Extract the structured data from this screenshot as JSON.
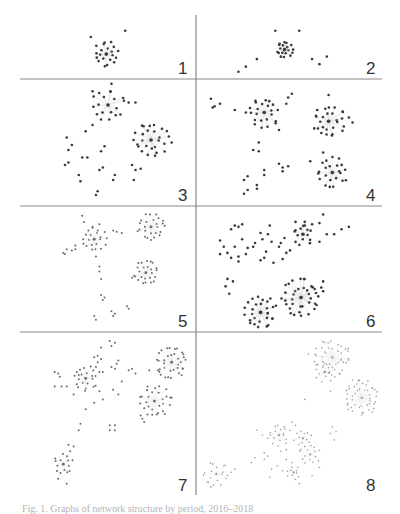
{
  "figure": {
    "caption": "Fig. 1. Graphs of network structure by period, 2016–2018",
    "panels": [
      {
        "label": "1",
        "density": "dark",
        "clusters": [
          {
            "cx": 0.49,
            "cy": 0.62,
            "r": 0.18,
            "n": 20
          }
        ],
        "satellites": [
          [
            0.4,
            0.35
          ],
          [
            0.6,
            0.25
          ]
        ]
      },
      {
        "label": "2",
        "density": "dark",
        "clusters": [
          {
            "cx": 0.47,
            "cy": 0.55,
            "r": 0.12,
            "n": 18
          }
        ],
        "satellites": [
          [
            0.42,
            0.25
          ],
          [
            0.55,
            0.25
          ],
          [
            0.32,
            0.7
          ],
          [
            0.26,
            0.82
          ],
          [
            0.22,
            0.9
          ],
          [
            0.62,
            0.7
          ],
          [
            0.66,
            0.78
          ],
          [
            0.7,
            0.66
          ]
        ]
      },
      {
        "label": "3",
        "density": "dark",
        "clusters": [
          {
            "cx": 0.5,
            "cy": 0.2,
            "r": 0.12,
            "n": 18
          },
          {
            "cx": 0.75,
            "cy": 0.48,
            "r": 0.13,
            "n": 26
          }
        ],
        "satellites": [
          [
            0.52,
            0.03
          ],
          [
            0.41,
            0.09
          ],
          [
            0.62,
            0.18
          ],
          [
            0.66,
            0.18
          ],
          [
            0.41,
            0.36
          ],
          [
            0.37,
            0.41
          ],
          [
            0.26,
            0.46
          ],
          [
            0.29,
            0.52
          ],
          [
            0.27,
            0.56
          ],
          [
            0.48,
            0.53
          ],
          [
            0.46,
            0.57
          ],
          [
            0.35,
            0.62
          ],
          [
            0.38,
            0.62
          ],
          [
            0.25,
            0.68
          ],
          [
            0.27,
            0.66
          ],
          [
            0.64,
            0.68
          ],
          [
            0.66,
            0.72
          ],
          [
            0.69,
            0.71
          ],
          [
            0.65,
            0.8
          ],
          [
            0.45,
            0.72
          ],
          [
            0.47,
            0.7
          ],
          [
            0.33,
            0.76
          ],
          [
            0.34,
            0.81
          ],
          [
            0.54,
            0.76
          ],
          [
            0.53,
            0.8
          ],
          [
            0.44,
            0.89
          ],
          [
            0.43,
            0.92
          ],
          [
            0.87,
            0.5
          ]
        ]
      },
      {
        "label": "4",
        "density": "dark",
        "clusters": [
          {
            "cx": 0.36,
            "cy": 0.26,
            "r": 0.11,
            "n": 22
          },
          {
            "cx": 0.71,
            "cy": 0.33,
            "r": 0.12,
            "n": 26
          },
          {
            "cx": 0.73,
            "cy": 0.74,
            "r": 0.11,
            "n": 22
          }
        ],
        "satellites": [
          [
            0.07,
            0.15
          ],
          [
            0.09,
            0.21
          ],
          [
            0.12,
            0.19
          ],
          [
            0.08,
            0.22
          ],
          [
            0.2,
            0.24
          ],
          [
            0.26,
            0.26
          ],
          [
            0.48,
            0.19
          ],
          [
            0.51,
            0.11
          ],
          [
            0.49,
            0.14
          ],
          [
            0.44,
            0.4
          ],
          [
            0.71,
            0.12
          ],
          [
            0.82,
            0.3
          ],
          [
            0.84,
            0.34
          ],
          [
            0.33,
            0.5
          ],
          [
            0.3,
            0.56
          ],
          [
            0.33,
            0.57
          ],
          [
            0.44,
            0.67
          ],
          [
            0.46,
            0.7
          ],
          [
            0.49,
            0.69
          ],
          [
            0.46,
            0.73
          ],
          [
            0.36,
            0.72
          ],
          [
            0.36,
            0.76
          ],
          [
            0.27,
            0.77
          ],
          [
            0.25,
            0.8
          ],
          [
            0.32,
            0.84
          ],
          [
            0.32,
            0.87
          ],
          [
            0.27,
            0.88
          ],
          [
            0.25,
            0.91
          ],
          [
            0.61,
            0.65
          ],
          [
            0.68,
            0.58
          ]
        ]
      },
      {
        "label": "5",
        "density": "light",
        "clusters": [
          {
            "cx": 0.42,
            "cy": 0.26,
            "r": 0.09,
            "n": 20
          },
          {
            "cx": 0.75,
            "cy": 0.16,
            "r": 0.1,
            "n": 24
          },
          {
            "cx": 0.72,
            "cy": 0.53,
            "r": 0.09,
            "n": 24
          }
        ],
        "satellites": [
          [
            0.35,
            0.07
          ],
          [
            0.36,
            0.12
          ],
          [
            0.41,
            0.16
          ],
          [
            0.45,
            0.14
          ],
          [
            0.53,
            0.19
          ],
          [
            0.55,
            0.2
          ],
          [
            0.58,
            0.21
          ],
          [
            0.31,
            0.31
          ],
          [
            0.31,
            0.34
          ],
          [
            0.29,
            0.35
          ],
          [
            0.26,
            0.34
          ],
          [
            0.24,
            0.37
          ],
          [
            0.25,
            0.38
          ],
          [
            0.43,
            0.4
          ],
          [
            0.45,
            0.48
          ],
          [
            0.45,
            0.52
          ],
          [
            0.46,
            0.58
          ],
          [
            0.46,
            0.71
          ],
          [
            0.48,
            0.73
          ],
          [
            0.47,
            0.75
          ],
          [
            0.64,
            0.57
          ],
          [
            0.61,
            0.8
          ],
          [
            0.62,
            0.82
          ],
          [
            0.52,
            0.84
          ],
          [
            0.54,
            0.86
          ],
          [
            0.53,
            0.88
          ],
          [
            0.42,
            0.88
          ],
          [
            0.43,
            0.91
          ],
          [
            0.82,
            0.11
          ]
        ]
      },
      {
        "label": "6",
        "density": "dark",
        "clusters": [
          {
            "cx": 0.57,
            "cy": 0.22,
            "r": 0.08,
            "n": 14
          },
          {
            "cx": 0.56,
            "cy": 0.73,
            "r": 0.14,
            "n": 36
          },
          {
            "cx": 0.34,
            "cy": 0.85,
            "r": 0.12,
            "n": 28
          }
        ],
        "satellites": [
          [
            0.18,
            0.18
          ],
          [
            0.2,
            0.15
          ],
          [
            0.22,
            0.16
          ],
          [
            0.24,
            0.14
          ],
          [
            0.12,
            0.27
          ],
          [
            0.14,
            0.32
          ],
          [
            0.12,
            0.38
          ],
          [
            0.16,
            0.37
          ],
          [
            0.2,
            0.32
          ],
          [
            0.22,
            0.4
          ],
          [
            0.26,
            0.38
          ],
          [
            0.22,
            0.44
          ],
          [
            0.18,
            0.41
          ],
          [
            0.24,
            0.26
          ],
          [
            0.27,
            0.33
          ],
          [
            0.3,
            0.32
          ],
          [
            0.31,
            0.29
          ],
          [
            0.34,
            0.21
          ],
          [
            0.35,
            0.26
          ],
          [
            0.37,
            0.36
          ],
          [
            0.38,
            0.22
          ],
          [
            0.39,
            0.15
          ],
          [
            0.4,
            0.28
          ],
          [
            0.45,
            0.29
          ],
          [
            0.44,
            0.32
          ],
          [
            0.47,
            0.25
          ],
          [
            0.48,
            0.37
          ],
          [
            0.46,
            0.42
          ],
          [
            0.41,
            0.45
          ],
          [
            0.36,
            0.41
          ],
          [
            0.34,
            0.43
          ],
          [
            0.5,
            0.35
          ],
          [
            0.53,
            0.12
          ],
          [
            0.58,
            0.12
          ],
          [
            0.62,
            0.14
          ],
          [
            0.66,
            0.13
          ],
          [
            0.68,
            0.06
          ],
          [
            0.7,
            0.22
          ],
          [
            0.74,
            0.22
          ],
          [
            0.78,
            0.18
          ],
          [
            0.82,
            0.16
          ],
          [
            0.66,
            0.28
          ],
          [
            0.16,
            0.58
          ],
          [
            0.15,
            0.64
          ],
          [
            0.19,
            0.6
          ],
          [
            0.17,
            0.7
          ],
          [
            0.67,
            0.65
          ],
          [
            0.68,
            0.68
          ],
          [
            0.68,
            0.6
          ]
        ]
      },
      {
        "label": "7",
        "density": "light",
        "clusters": [
          {
            "cx": 0.37,
            "cy": 0.28,
            "r": 0.07,
            "n": 20
          },
          {
            "cx": 0.87,
            "cy": 0.18,
            "r": 0.09,
            "n": 34
          },
          {
            "cx": 0.77,
            "cy": 0.42,
            "r": 0.09,
            "n": 26
          },
          {
            "cx": 0.24,
            "cy": 0.81,
            "r": 0.06,
            "n": 14
          }
        ],
        "satellites": [
          [
            0.51,
            0.05
          ],
          [
            0.54,
            0.06
          ],
          [
            0.52,
            0.08
          ],
          [
            0.46,
            0.09
          ],
          [
            0.44,
            0.14
          ],
          [
            0.42,
            0.15
          ],
          [
            0.46,
            0.16
          ],
          [
            0.44,
            0.18
          ],
          [
            0.43,
            0.21
          ],
          [
            0.45,
            0.24
          ],
          [
            0.47,
            0.24
          ],
          [
            0.52,
            0.21
          ],
          [
            0.55,
            0.19
          ],
          [
            0.56,
            0.17
          ],
          [
            0.54,
            0.22
          ],
          [
            0.62,
            0.23
          ],
          [
            0.64,
            0.22
          ],
          [
            0.66,
            0.25
          ],
          [
            0.74,
            0.23
          ],
          [
            0.79,
            0.23
          ],
          [
            0.19,
            0.24
          ],
          [
            0.21,
            0.25
          ],
          [
            0.22,
            0.27
          ],
          [
            0.19,
            0.33
          ],
          [
            0.23,
            0.33
          ],
          [
            0.26,
            0.33
          ],
          [
            0.3,
            0.38
          ],
          [
            0.33,
            0.26
          ],
          [
            0.45,
            0.36
          ],
          [
            0.47,
            0.41
          ],
          [
            0.53,
            0.35
          ],
          [
            0.56,
            0.38
          ],
          [
            0.58,
            0.3
          ],
          [
            0.42,
            0.43
          ],
          [
            0.37,
            0.47
          ],
          [
            0.73,
            0.33
          ],
          [
            0.69,
            0.51
          ],
          [
            0.7,
            0.53
          ],
          [
            0.71,
            0.55
          ],
          [
            0.83,
            0.5
          ],
          [
            0.87,
            0.4
          ],
          [
            0.34,
            0.56
          ],
          [
            0.33,
            0.6
          ],
          [
            0.51,
            0.57
          ],
          [
            0.54,
            0.57
          ],
          [
            0.51,
            0.6
          ],
          [
            0.54,
            0.6
          ],
          [
            0.27,
            0.69
          ],
          [
            0.3,
            0.7
          ],
          [
            0.28,
            0.73
          ],
          [
            0.21,
            0.9
          ],
          [
            0.26,
            0.93
          ]
        ]
      },
      {
        "label": "8",
        "density": "faint",
        "clusters": [
          {
            "cx": 0.73,
            "cy": 0.15,
            "r": 0.1,
            "n": 40
          },
          {
            "cx": 0.69,
            "cy": 0.24,
            "r": 0.06,
            "n": 14
          },
          {
            "cx": 0.89,
            "cy": 0.4,
            "r": 0.1,
            "n": 44
          },
          {
            "cx": 0.44,
            "cy": 0.63,
            "r": 0.06,
            "n": 16
          },
          {
            "cx": 0.57,
            "cy": 0.65,
            "r": 0.05,
            "n": 12
          },
          {
            "cx": 0.61,
            "cy": 0.75,
            "r": 0.06,
            "n": 14
          },
          {
            "cx": 0.1,
            "cy": 0.87,
            "r": 0.07,
            "n": 16
          },
          {
            "cx": 0.52,
            "cy": 0.86,
            "r": 0.04,
            "n": 10
          }
        ],
        "satellites": [
          [
            0.6,
            0.13
          ],
          [
            0.79,
            0.18
          ],
          [
            0.84,
            0.29
          ],
          [
            0.85,
            0.33
          ],
          [
            0.72,
            0.36
          ],
          [
            0.58,
            0.41
          ],
          [
            0.51,
            0.55
          ],
          [
            0.53,
            0.57
          ],
          [
            0.5,
            0.6
          ],
          [
            0.32,
            0.6
          ],
          [
            0.35,
            0.63
          ],
          [
            0.38,
            0.65
          ],
          [
            0.73,
            0.58
          ],
          [
            0.72,
            0.62
          ],
          [
            0.75,
            0.61
          ],
          [
            0.74,
            0.66
          ],
          [
            0.36,
            0.74
          ],
          [
            0.38,
            0.76
          ],
          [
            0.36,
            0.78
          ],
          [
            0.31,
            0.77
          ],
          [
            0.29,
            0.8
          ],
          [
            0.45,
            0.73
          ],
          [
            0.48,
            0.72
          ],
          [
            0.48,
            0.78
          ],
          [
            0.51,
            0.8
          ],
          [
            0.4,
            0.84
          ],
          [
            0.43,
            0.82
          ],
          [
            0.46,
            0.85
          ],
          [
            0.39,
            0.89
          ],
          [
            0.2,
            0.84
          ],
          [
            0.18,
            0.86
          ],
          [
            0.16,
            0.88
          ],
          [
            0.05,
            0.92
          ],
          [
            0.07,
            0.95
          ],
          [
            0.66,
            0.83
          ],
          [
            0.62,
            0.88
          ],
          [
            0.55,
            0.93
          ]
        ]
      }
    ]
  }
}
